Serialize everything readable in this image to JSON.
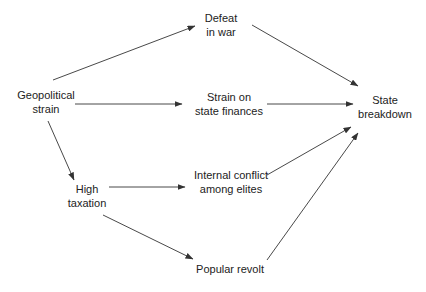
{
  "diagram": {
    "type": "causal-flow",
    "colors": {
      "line": "#333333",
      "text": "#222222",
      "background": "#ffffff"
    },
    "nodes": [
      {
        "id": "geopolitical",
        "lines": [
          "Geopolitical",
          "strain"
        ],
        "x": 46,
        "y": 89
      },
      {
        "id": "defeat",
        "lines": [
          "Defeat",
          "in war"
        ],
        "x": 221,
        "y": 12
      },
      {
        "id": "finances",
        "lines": [
          "Strain on",
          "state finances"
        ],
        "x": 229,
        "y": 91
      },
      {
        "id": "breakdown",
        "lines": [
          "State",
          "breakdown"
        ],
        "x": 385,
        "y": 94
      },
      {
        "id": "taxation",
        "lines": [
          "High",
          "taxation"
        ],
        "x": 87,
        "y": 183
      },
      {
        "id": "elites",
        "lines": [
          "Internal conflict",
          "among elites"
        ],
        "x": 231,
        "y": 169
      },
      {
        "id": "revolt",
        "lines": [
          "Popular revolt"
        ],
        "x": 230,
        "y": 263
      }
    ],
    "edges": [
      {
        "from": "geopolitical",
        "to": "defeat",
        "x1": 53,
        "y1": 80,
        "x2": 195,
        "y2": 26
      },
      {
        "from": "geopolitical",
        "to": "finances",
        "x1": 75,
        "y1": 104,
        "x2": 182,
        "y2": 104
      },
      {
        "from": "geopolitical",
        "to": "taxation",
        "x1": 48,
        "y1": 121,
        "x2": 74,
        "y2": 180
      },
      {
        "from": "defeat",
        "to": "breakdown",
        "x1": 252,
        "y1": 25,
        "x2": 358,
        "y2": 86
      },
      {
        "from": "finances",
        "to": "breakdown",
        "x1": 267,
        "y1": 104,
        "x2": 353,
        "y2": 104
      },
      {
        "from": "taxation",
        "to": "elites",
        "x1": 109,
        "y1": 187,
        "x2": 185,
        "y2": 187
      },
      {
        "from": "taxation",
        "to": "revolt",
        "x1": 103,
        "y1": 215,
        "x2": 193,
        "y2": 259
      },
      {
        "from": "elites",
        "to": "breakdown",
        "x1": 267,
        "y1": 175,
        "x2": 351,
        "y2": 127
      },
      {
        "from": "revolt",
        "to": "breakdown",
        "x1": 267,
        "y1": 260,
        "x2": 358,
        "y2": 133
      }
    ]
  }
}
